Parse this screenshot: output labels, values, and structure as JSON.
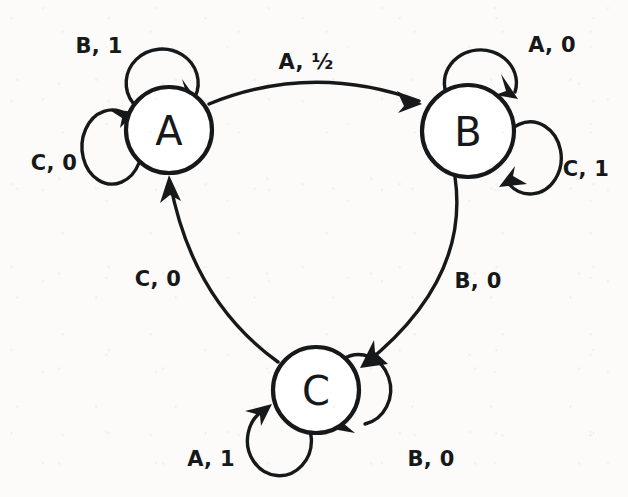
{
  "diagram": {
    "type": "finite-state-machine",
    "title": "",
    "width": 628,
    "height": 497,
    "colors": {
      "ink": "#17181a",
      "paper": "#fcfbf9",
      "node_fill": "#ffffff"
    },
    "states": [
      {
        "id": "A",
        "label": "A",
        "cx": 169,
        "cy": 130,
        "r": 43
      },
      {
        "id": "B",
        "label": "B",
        "cx": 468,
        "cy": 131,
        "r": 46
      },
      {
        "id": "C",
        "label": "C",
        "cx": 316,
        "cy": 390,
        "r": 43
      }
    ],
    "transitions": [
      {
        "id": "a-to-b",
        "from": "A",
        "to": "B",
        "label": "A, ½",
        "input": "A",
        "output": "½",
        "kind": "arc",
        "label_x": 306,
        "label_y": 62
      },
      {
        "id": "b-to-c",
        "from": "B",
        "to": "C",
        "label": "B, 0",
        "input": "B",
        "output": "0",
        "kind": "arc",
        "label_x": 478,
        "label_y": 281
      },
      {
        "id": "c-to-a",
        "from": "C",
        "to": "A",
        "label": "C, 0",
        "input": "C",
        "output": "0",
        "kind": "arc",
        "label_x": 158,
        "label_y": 279
      },
      {
        "id": "a-self-b1",
        "from": "A",
        "to": "A",
        "label": "B, 1",
        "input": "B",
        "output": "1",
        "kind": "self-loop",
        "label_x": 99,
        "label_y": 46
      },
      {
        "id": "a-self-c0",
        "from": "A",
        "to": "A",
        "label": "C, 0",
        "input": "C",
        "output": "0",
        "kind": "self-loop",
        "label_x": 54,
        "label_y": 163
      },
      {
        "id": "b-self-a0",
        "from": "B",
        "to": "B",
        "label": "A, 0",
        "input": "A",
        "output": "0",
        "kind": "self-loop",
        "label_x": 552,
        "label_y": 45
      },
      {
        "id": "b-self-c1",
        "from": "B",
        "to": "B",
        "label": "C, 1",
        "input": "C",
        "output": "1",
        "kind": "self-loop",
        "label_x": 586,
        "label_y": 169
      },
      {
        "id": "c-self-a1",
        "from": "C",
        "to": "C",
        "label": "A, 1",
        "input": "A",
        "output": "1",
        "kind": "self-loop",
        "label_x": 211,
        "label_y": 459
      },
      {
        "id": "c-self-b0",
        "from": "C",
        "to": "C",
        "label": "B, 0",
        "input": "B",
        "output": "0",
        "kind": "self-loop",
        "label_x": 431,
        "label_y": 459
      }
    ]
  }
}
